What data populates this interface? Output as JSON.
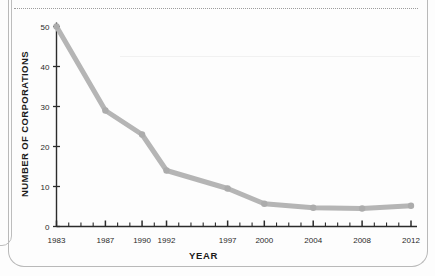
{
  "chart_data": {
    "type": "line",
    "title": "",
    "xlabel": "YEAR",
    "ylabel": "NUMBER OF CORPORATIONS",
    "x": [
      1983,
      1987,
      1990,
      1992,
      1997,
      2000,
      2004,
      2008,
      2012
    ],
    "values": [
      50,
      29,
      23,
      14,
      9.5,
      5.7,
      4.7,
      4.5,
      5.2
    ],
    "series": [
      {
        "name": "Number of corporations",
        "values": [
          50,
          29,
          23,
          14,
          9.5,
          5.7,
          4.7,
          4.5,
          5.2
        ],
        "color": "#b5b5b5"
      }
    ],
    "xtick_labels": [
      "1983",
      "1987",
      "1990",
      "1992",
      "1997",
      "2000",
      "2004",
      "2008",
      "2012"
    ],
    "ytick_labels": [
      "0",
      "10",
      "20",
      "30",
      "40",
      "50"
    ],
    "ytick_values": [
      0,
      10,
      20,
      30,
      40,
      50
    ],
    "xlim": [
      1983,
      2012
    ],
    "ylim": [
      0,
      52
    ],
    "minor_xticks_every": 1,
    "grid": false,
    "legend": "none",
    "marker": "circle",
    "line_color": "#b5b5b5",
    "axis_color": "#2b2b2b"
  },
  "axes": {
    "y_title": "NUMBER OF CORPORATIONS",
    "x_title": "YEAR"
  },
  "artifacts": {
    "dotted_rule": "dotted-separator-line",
    "page_border": "rounded-page-frame"
  }
}
